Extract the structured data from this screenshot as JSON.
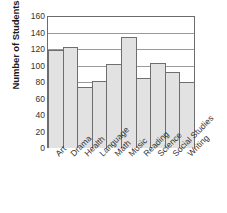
{
  "chart_data": {
    "type": "bar",
    "title": "",
    "xlabel": "",
    "ylabel": "Number of Students",
    "ylim": [
      0,
      160
    ],
    "ytick_values": [
      0,
      20,
      40,
      60,
      80,
      100,
      120,
      140,
      160
    ],
    "ytick_labels": [
      "0",
      "20",
      "40",
      "60",
      "80",
      "100",
      "120",
      "140",
      "160"
    ],
    "grid": true,
    "legend": false,
    "categories": [
      "Art",
      "Drama",
      "Health",
      "Language",
      "Math",
      "Music",
      "Reading",
      "Science",
      "Social Studies",
      "Writing"
    ],
    "values": [
      120,
      123,
      75,
      82,
      103,
      135,
      86,
      104,
      93,
      81
    ],
    "bar_fill_color": "#e2e2e2",
    "bar_border_color": "#6e6e6e",
    "gridline_color": "#9a9a9a",
    "frame_color": "#6b6b6b"
  }
}
